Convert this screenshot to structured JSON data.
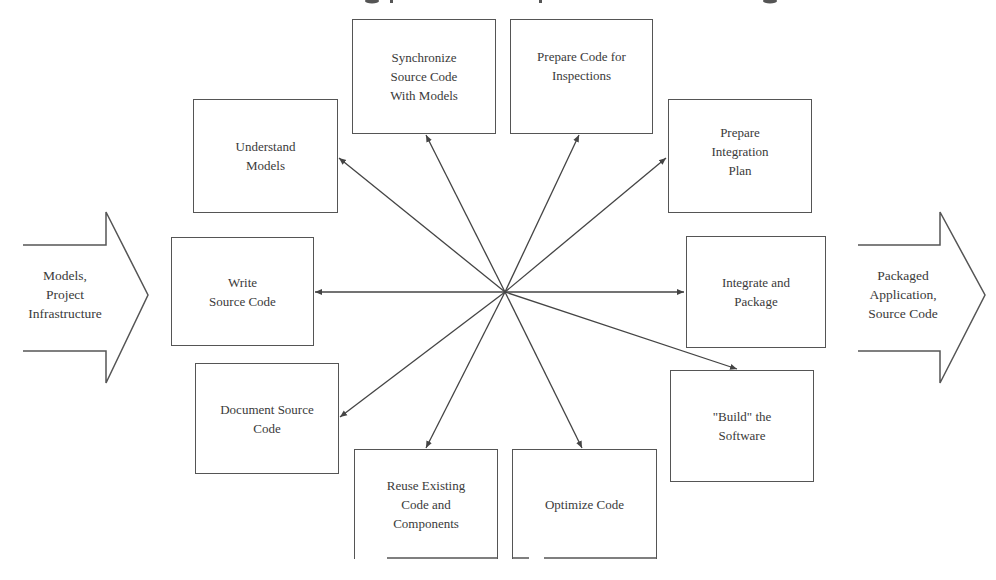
{
  "diagram": {
    "hub": {
      "x": 505,
      "y": 292
    },
    "input_arrow": {
      "label": "Models,\nProject\nInfrastructure"
    },
    "output_arrow": {
      "label": "Packaged\nApplication,\nSource Code"
    },
    "activities": [
      {
        "id": "understand-models",
        "label": "Understand\nModels"
      },
      {
        "id": "synchronize-source-code",
        "label": "Synchronize\nSource Code\nWith Models"
      },
      {
        "id": "prepare-code-inspections",
        "label": "Prepare Code for\nInspections"
      },
      {
        "id": "prepare-integration-plan",
        "label": "Prepare\nIntegration\nPlan"
      },
      {
        "id": "integrate-and-package",
        "label": "Integrate and\nPackage"
      },
      {
        "id": "build-software",
        "label": "\"Build\" the\nSoftware"
      },
      {
        "id": "optimize-code",
        "label": "Optimize Code"
      },
      {
        "id": "reuse-existing-code",
        "label": "Reuse Existing\nCode and\nComponents"
      },
      {
        "id": "document-source-code",
        "label": "Document Source\nCode"
      },
      {
        "id": "write-source-code",
        "label": "Write\nSource Code"
      }
    ],
    "colors": {
      "line": "#444444",
      "box_border": "#555555",
      "text": "#3a3a3a",
      "background": "#ffffff"
    }
  }
}
